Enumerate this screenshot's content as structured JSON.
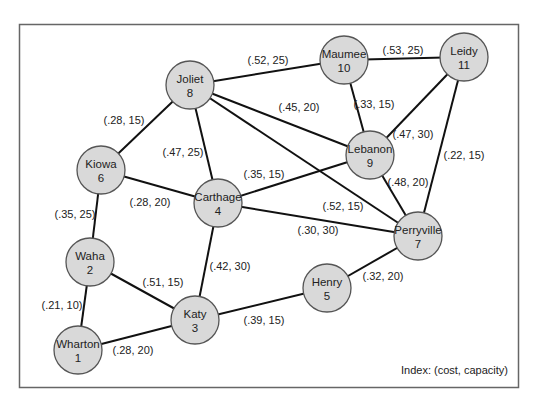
{
  "diagram": {
    "title": "",
    "index_label": "Index: (cost, capacity)",
    "colors": {
      "node_fill": "#d9d9d9",
      "node_stroke": "#555555",
      "edge": "#111111",
      "frame": "#666666"
    },
    "nodes": [
      {
        "id": 1,
        "name": "Wharton",
        "number": "1",
        "x": 78,
        "y": 350
      },
      {
        "id": 2,
        "name": "Waha",
        "number": "2",
        "x": 90,
        "y": 262
      },
      {
        "id": 3,
        "name": "Katy",
        "number": "3",
        "x": 195,
        "y": 320
      },
      {
        "id": 4,
        "name": "Carthage",
        "number": "4",
        "x": 218,
        "y": 203
      },
      {
        "id": 5,
        "name": "Henry",
        "number": "5",
        "x": 327,
        "y": 288
      },
      {
        "id": 6,
        "name": "Kiowa",
        "number": "6",
        "x": 101,
        "y": 170
      },
      {
        "id": 7,
        "name": "Perryville",
        "number": "7",
        "x": 418,
        "y": 236
      },
      {
        "id": 8,
        "name": "Joliet",
        "number": "8",
        "x": 190,
        "y": 85
      },
      {
        "id": 9,
        "name": "Lebanon",
        "number": "9",
        "x": 370,
        "y": 155
      },
      {
        "id": 10,
        "name": "Maumee",
        "number": "10",
        "x": 344,
        "y": 60
      },
      {
        "id": 11,
        "name": "Leidy",
        "number": "11",
        "x": 464,
        "y": 57
      }
    ],
    "edges": [
      {
        "from": 8,
        "to": 10,
        "label": "(.52, 25)",
        "lx": 268,
        "ly": 64
      },
      {
        "from": 10,
        "to": 11,
        "label": "(.53, 25)",
        "lx": 403,
        "ly": 54
      },
      {
        "from": 8,
        "to": 6,
        "label": "(.28, 15)",
        "lx": 124,
        "ly": 124
      },
      {
        "from": 8,
        "to": 4,
        "label": "(.47, 25)",
        "lx": 183,
        "ly": 156
      },
      {
        "from": 8,
        "to": 9,
        "label": "(.45, 20)",
        "lx": 299,
        "ly": 111
      },
      {
        "from": 8,
        "to": 7,
        "label": "(.52, 15)",
        "lx": 343,
        "ly": 210
      },
      {
        "from": 10,
        "to": 9,
        "label": "(.33, 15)",
        "lx": 374,
        "ly": 108
      },
      {
        "from": 11,
        "to": 9,
        "label": "(.47, 30)",
        "lx": 413,
        "ly": 138
      },
      {
        "from": 11,
        "to": 7,
        "label": "(.22, 15)",
        "lx": 464,
        "ly": 159
      },
      {
        "from": 9,
        "to": 7,
        "label": "(.48, 20)",
        "lx": 408,
        "ly": 186
      },
      {
        "from": 6,
        "to": 4,
        "label": "(.28, 20)",
        "lx": 150,
        "ly": 206
      },
      {
        "from": 6,
        "to": 2,
        "label": "(.35, 25)",
        "lx": 75,
        "ly": 218
      },
      {
        "from": 4,
        "to": 9,
        "label": "(.35, 15)",
        "lx": 264,
        "ly": 178
      },
      {
        "from": 4,
        "to": 7,
        "label": "(.30, 30)",
        "lx": 318,
        "ly": 234
      },
      {
        "from": 4,
        "to": 3,
        "label": "(.42, 30)",
        "lx": 230,
        "ly": 270
      },
      {
        "from": 2,
        "to": 3,
        "label": "(.51, 15)",
        "lx": 163,
        "ly": 286
      },
      {
        "from": 2,
        "to": 1,
        "label": "(.21, 10)",
        "lx": 62,
        "ly": 309
      },
      {
        "from": 1,
        "to": 3,
        "label": "(.28, 20)",
        "lx": 133,
        "ly": 354
      },
      {
        "from": 3,
        "to": 5,
        "label": "(.39, 15)",
        "lx": 264,
        "ly": 324
      },
      {
        "from": 5,
        "to": 7,
        "label": "(.32, 20)",
        "lx": 383,
        "ly": 280
      }
    ]
  }
}
